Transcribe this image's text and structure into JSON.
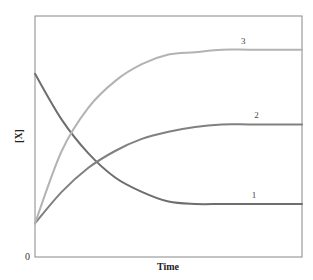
{
  "chart_data": {
    "type": "line",
    "title": "",
    "xlabel": "Time",
    "ylabel": "[X]",
    "x_ticks": [],
    "y_ticks": [
      "0"
    ],
    "xlim": [
      0,
      1
    ],
    "ylim": [
      0,
      1
    ],
    "grid": false,
    "legend": "inline curve labels",
    "x": [
      0,
      0.1,
      0.2,
      0.3,
      0.4,
      0.5,
      0.6,
      0.7,
      0.8,
      0.9,
      1.0
    ],
    "series": [
      {
        "name": "1",
        "label": "1",
        "color": "#6e6e6e",
        "values": [
          0.76,
          0.57,
          0.43,
          0.33,
          0.27,
          0.23,
          0.22,
          0.22,
          0.22,
          0.22,
          0.22
        ]
      },
      {
        "name": "2",
        "label": "2",
        "color": "#808080",
        "values": [
          0.14,
          0.27,
          0.37,
          0.44,
          0.49,
          0.52,
          0.54,
          0.55,
          0.55,
          0.55,
          0.55
        ]
      },
      {
        "name": "3",
        "label": "3",
        "color": "#b3b3b3",
        "values": [
          0.14,
          0.44,
          0.62,
          0.73,
          0.8,
          0.84,
          0.85,
          0.86,
          0.86,
          0.86,
          0.86
        ]
      }
    ]
  },
  "plot": {
    "frame_color": "#888888",
    "origin_label": "0"
  }
}
